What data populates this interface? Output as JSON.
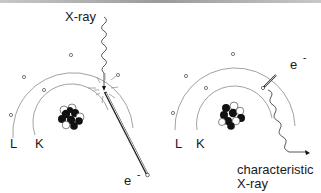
{
  "diagram": {
    "panels": [
      {
        "id": "ionization",
        "labels": {
          "incoming": "X-ray",
          "shell_outer": "L",
          "shell_inner": "K",
          "ejected": "e",
          "ejected_charge": "-"
        }
      },
      {
        "id": "emission",
        "labels": {
          "electron": "e",
          "electron_charge": "-",
          "shell_outer": "L",
          "shell_inner": "K",
          "emitted_line1": "characteristic",
          "emitted_line2": "X-ray"
        }
      }
    ],
    "colors": {
      "shell": "#8a8a8a",
      "text": "#1a1a1a",
      "nucleus": "#111111",
      "background": "#ffffff"
    }
  }
}
